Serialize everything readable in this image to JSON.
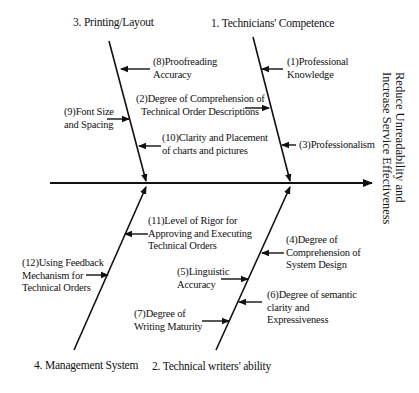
{
  "diagram": {
    "type": "fishbone",
    "effect": {
      "line1": "Reduce Unreadability and",
      "line2": "Increase Service Effectiveness"
    },
    "categories": [
      {
        "id": "cat-1",
        "label": "1. Technicians' Competence",
        "position": "top-right"
      },
      {
        "id": "cat-2",
        "label": "2. Technical writers' ability",
        "position": "bottom-right"
      },
      {
        "id": "cat-3",
        "label": "3. Printing/Layout",
        "position": "top-left"
      },
      {
        "id": "cat-4",
        "label": "4. Management System",
        "position": "bottom-left"
      }
    ],
    "causes": {
      "c1": {
        "line1": "(1)Professional",
        "line2": "Knowledge",
        "category": "1. Technicians' Competence"
      },
      "c2": {
        "line1": "(2)Degree of Comprehension of",
        "line2": "Technical Order Descriptions",
        "category": "1. Technicians' Competence"
      },
      "c3": {
        "line1": "(3)Professionalism",
        "category": "1. Technicians' Competence"
      },
      "c4": {
        "line1": "(4)Degree of",
        "line2": "Comprehension of",
        "line3": "System Design",
        "category": "2. Technical writers' ability"
      },
      "c5": {
        "line1": "(5)Linguistic",
        "line2": "Accuracy",
        "category": "2. Technical writers' ability"
      },
      "c6": {
        "line1": "(6)Degree of semantic",
        "line2": "clarity and",
        "line3": "Expressiveness",
        "category": "2. Technical writers' ability"
      },
      "c7": {
        "line1": "(7)Degree of",
        "line2": "Writing Maturity",
        "category": "2. Technical writers' ability"
      },
      "c8": {
        "line1": "(8)Proofreading",
        "line2": "Accuracy",
        "category": "3. Printing/Layout"
      },
      "c9": {
        "line1": "(9)Font Size",
        "line2": "and Spacing",
        "category": "3. Printing/Layout"
      },
      "c10": {
        "line1": "(10)Clarity and Placement",
        "line2": "of charts and pictures",
        "category": "3. Printing/Layout"
      },
      "c11": {
        "line1": "(11)Level of Rigor for",
        "line2": "Approving and Executing",
        "line3": "Technical Orders",
        "category": "4. Management System"
      },
      "c12": {
        "line1": "(12)Using Feedback",
        "line2": "Mechanism for",
        "line3": "Technical Orders",
        "category": "4. Management System"
      }
    },
    "colors": {
      "line": "#111111",
      "background": "#ffffff"
    }
  }
}
